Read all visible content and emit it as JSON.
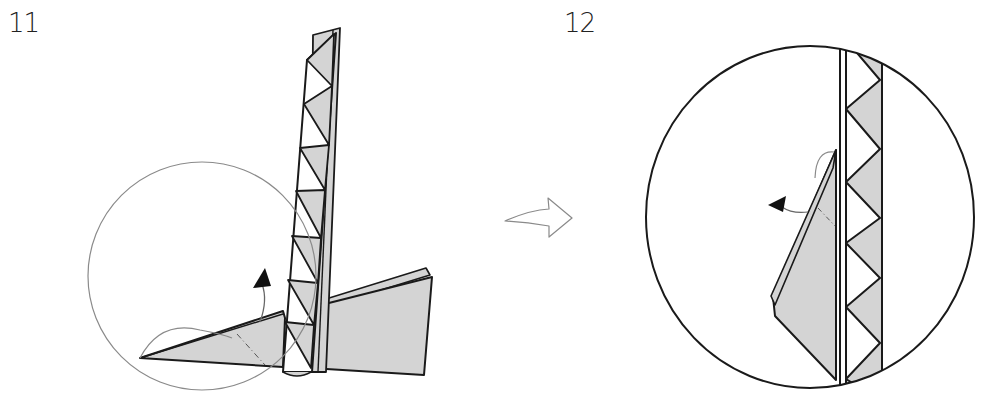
{
  "diagram": {
    "type": "origami-instructions",
    "steps": [
      {
        "number": "11",
        "description": "Strip standing vertically over two grey wings; large thin circle marks detail area; curved arrow indicates lifting the left flap.",
        "arrow": "curved-up-arrow"
      },
      {
        "number": "12",
        "description": "Enlarged circular detail view of the strip with zig-zag triangle pattern; left flap swung out with arrow pointing left.",
        "arrow": "curved-left-arrow"
      }
    ],
    "transition_arrow": "outline-curved-right-arrow",
    "colors": {
      "fill_grey": "#d4d4d4",
      "line": "#1a1a1a",
      "thin_line": "#8a8a8a",
      "background": "#ffffff"
    }
  }
}
